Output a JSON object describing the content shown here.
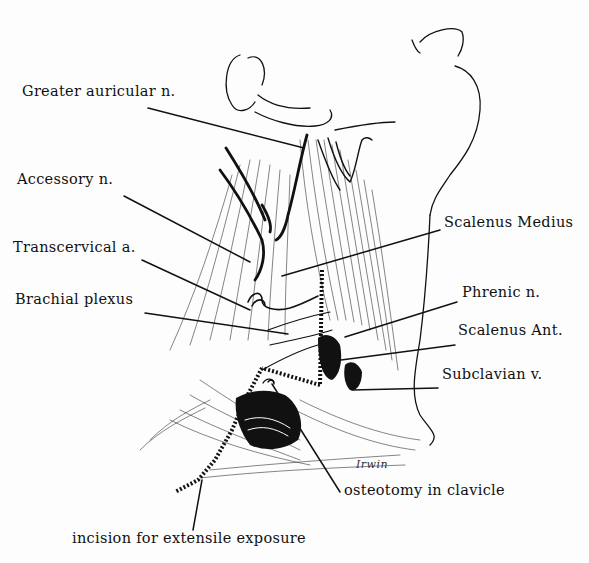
{
  "figure": {
    "type": "anatomical illustration",
    "signature": "Irwin",
    "colors": {
      "ink": "#111111",
      "background": "#fdfdfd"
    }
  },
  "labels": [
    {
      "id": "greater-auricular",
      "text": "Greater auricular n.",
      "x": 22,
      "y": 90
    },
    {
      "id": "accessory",
      "text": "Accessory n.",
      "x": 17,
      "y": 178
    },
    {
      "id": "transcervical",
      "text": "Transcervical a.",
      "x": 13,
      "y": 246
    },
    {
      "id": "brachial-plexus",
      "text": "Brachial plexus",
      "x": 15,
      "y": 297
    },
    {
      "id": "scalenus-medius",
      "text": "Scalenus Medius",
      "x": 444,
      "y": 221
    },
    {
      "id": "phrenic",
      "text": "Phrenic n.",
      "x": 462,
      "y": 291
    },
    {
      "id": "scalenus-ant",
      "text": "Scalenus Ant.",
      "x": 458,
      "y": 329
    },
    {
      "id": "subclavian-v",
      "text": "Subclavian v.",
      "x": 442,
      "y": 373
    },
    {
      "id": "osteotomy",
      "text": "osteotomy in clavicle",
      "x": 344,
      "y": 489
    },
    {
      "id": "incision",
      "text": "incision for extensile exposure",
      "x": 72,
      "y": 537
    }
  ]
}
